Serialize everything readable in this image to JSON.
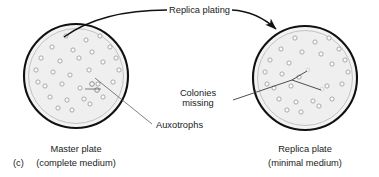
{
  "figure": {
    "panel_letter": "(c)",
    "process_label": "Replica plating",
    "annotations": {
      "auxotrophs": "Auxotrophs",
      "colonies_missing_line1": "Colonies",
      "colonies_missing_line2": "missing"
    },
    "left_plate": {
      "name": "master-plate",
      "caption_line1": "Master plate",
      "caption_line2": "(complete medium)",
      "center": {
        "x": 76,
        "y": 76
      },
      "outer_radius": 52,
      "inner_radius": 47,
      "colonies": [
        {
          "x": 66,
          "y": 36
        },
        {
          "x": 86,
          "y": 40
        },
        {
          "x": 100,
          "y": 36
        },
        {
          "x": 52,
          "y": 47
        },
        {
          "x": 73,
          "y": 50
        },
        {
          "x": 92,
          "y": 52
        },
        {
          "x": 110,
          "y": 47
        },
        {
          "x": 41,
          "y": 58
        },
        {
          "x": 60,
          "y": 61
        },
        {
          "x": 79,
          "y": 58
        },
        {
          "x": 103,
          "y": 62
        },
        {
          "x": 116,
          "y": 58
        },
        {
          "x": 36,
          "y": 70
        },
        {
          "x": 53,
          "y": 72
        },
        {
          "x": 70,
          "y": 75
        },
        {
          "x": 89,
          "y": 70
        },
        {
          "x": 119,
          "y": 70
        },
        {
          "x": 38,
          "y": 82
        },
        {
          "x": 45,
          "y": 86
        },
        {
          "x": 62,
          "y": 84
        },
        {
          "x": 80,
          "y": 88
        },
        {
          "x": 98,
          "y": 84
        },
        {
          "x": 113,
          "y": 82
        },
        {
          "x": 50,
          "y": 97
        },
        {
          "x": 67,
          "y": 100
        },
        {
          "x": 84,
          "y": 99
        },
        {
          "x": 90,
          "y": 104
        },
        {
          "x": 103,
          "y": 97
        },
        {
          "x": 72,
          "y": 110
        },
        {
          "x": 58,
          "y": 108
        }
      ],
      "auxotroph_markers": [
        {
          "x": 92,
          "y": 84
        },
        {
          "x": 97,
          "y": 90
        }
      ]
    },
    "right_plate": {
      "name": "replica-plate",
      "caption_line1": "Replica plate",
      "caption_line2": "(minimal medium)",
      "center": {
        "x": 305,
        "y": 78
      },
      "outer_radius": 52,
      "inner_radius": 47,
      "colonies": [
        {
          "x": 295,
          "y": 38
        },
        {
          "x": 315,
          "y": 42
        },
        {
          "x": 329,
          "y": 38
        },
        {
          "x": 281,
          "y": 49
        },
        {
          "x": 302,
          "y": 52
        },
        {
          "x": 321,
          "y": 54
        },
        {
          "x": 339,
          "y": 49
        },
        {
          "x": 270,
          "y": 60
        },
        {
          "x": 289,
          "y": 63
        },
        {
          "x": 332,
          "y": 64
        },
        {
          "x": 345,
          "y": 60
        },
        {
          "x": 265,
          "y": 72
        },
        {
          "x": 282,
          "y": 74
        },
        {
          "x": 299,
          "y": 77
        },
        {
          "x": 348,
          "y": 72
        },
        {
          "x": 267,
          "y": 84
        },
        {
          "x": 274,
          "y": 88
        },
        {
          "x": 291,
          "y": 86
        },
        {
          "x": 327,
          "y": 86
        },
        {
          "x": 342,
          "y": 84
        },
        {
          "x": 279,
          "y": 99
        },
        {
          "x": 296,
          "y": 102
        },
        {
          "x": 313,
          "y": 101
        },
        {
          "x": 319,
          "y": 106
        },
        {
          "x": 332,
          "y": 99
        },
        {
          "x": 301,
          "y": 112
        },
        {
          "x": 287,
          "y": 110
        }
      ],
      "missing_markers": [
        {
          "x": 308,
          "y": 70
        },
        {
          "x": 322,
          "y": 89
        }
      ]
    },
    "colors": {
      "plate_rim": "#1a1a1a",
      "plate_fill": "#f0f0f0",
      "plate_inner_ring": "#b8b8b8",
      "colony_stroke": "#9a9a9a",
      "colony_fill": "#fbfbfb",
      "leader_line": "#555555",
      "arrow": "#111111",
      "text": "#1a1a1a",
      "background": "#ffffff"
    }
  }
}
